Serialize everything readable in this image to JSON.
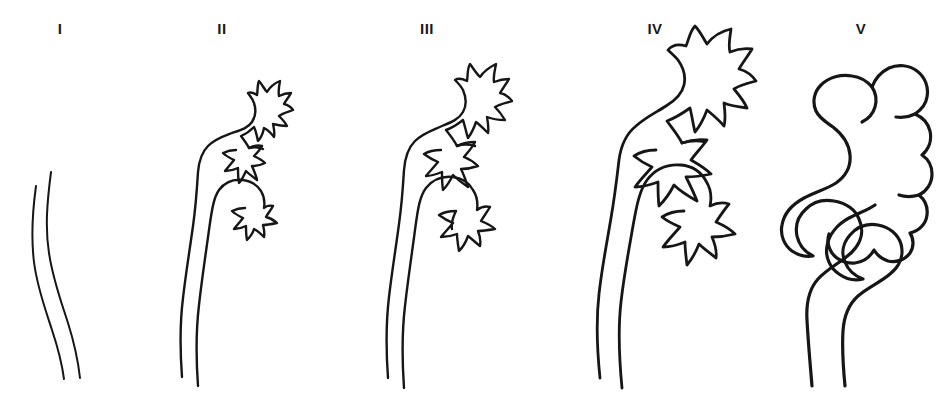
{
  "figure": {
    "background_color": "#ffffff",
    "ink_color": "#161616",
    "width": 949,
    "height": 409
  },
  "panels": [
    {
      "label": "I",
      "label_x": 60,
      "label_y": 28,
      "grade_number": 1,
      "ureter": "non-dilated, reflux into distal ureter only",
      "pelvis": "not visualized",
      "calyces": "not visualized",
      "has_pelvis": false,
      "has_calyces": false,
      "ureter_width": "thin",
      "tortuosity": "none"
    },
    {
      "label": "II",
      "label_x": 222,
      "label_y": 28,
      "grade_number": 2,
      "ureter": "non-dilated, reflux up to the renal pelvis",
      "pelvis": "normal calibre",
      "calyces": "sharp, normal fornices",
      "has_pelvis": true,
      "has_calyces": true,
      "ureter_width": "thin",
      "tortuosity": "none"
    },
    {
      "label": "III",
      "label_x": 427,
      "label_y": 28,
      "grade_number": 3,
      "ureter": "mild or moderate dilation, with or without kinking",
      "pelvis": "mild or moderate dilation",
      "calyces": "no or slight blunting of fornices",
      "has_pelvis": true,
      "has_calyces": true,
      "ureter_width": "mild",
      "tortuosity": "slight"
    },
    {
      "label": "IV",
      "label_x": 655,
      "label_y": 28,
      "grade_number": 4,
      "ureter": "moderate dilation and/or tortuosity",
      "pelvis": "moderate dilation",
      "calyces": "complete obliteration of sharp angle of fornices, papillary impressions preserved",
      "has_pelvis": true,
      "has_calyces": true,
      "ureter_width": "moderate",
      "tortuosity": "moderate"
    },
    {
      "label": "V",
      "label_x": 861,
      "label_y": 28,
      "grade_number": 5,
      "ureter": "gross dilation and tortuosity",
      "pelvis": "gross dilation",
      "calyces": "papillary impressions no longer visible in majority of calyces",
      "has_pelvis": true,
      "has_calyces": true,
      "ureter_width": "gross",
      "tortuosity": "severe"
    }
  ]
}
